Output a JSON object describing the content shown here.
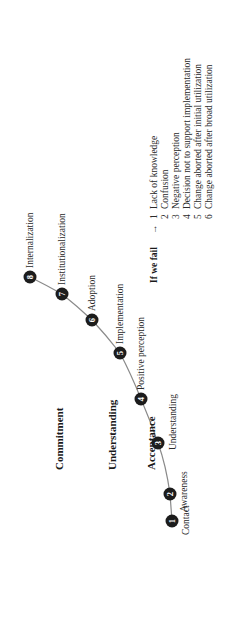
{
  "levels": [
    {
      "label": "Commitment"
    },
    {
      "label": "Understanding"
    },
    {
      "label": "Acceptance"
    }
  ],
  "stages": [
    {
      "num": "1",
      "label": "Contact"
    },
    {
      "num": "2",
      "label": "Awareness"
    },
    {
      "num": "3",
      "label": "Understanding"
    },
    {
      "num": "4",
      "label": "Positive perception"
    },
    {
      "num": "5",
      "label": "Implementation"
    },
    {
      "num": "6",
      "label": "Adoption"
    },
    {
      "num": "7",
      "label": "Institutionalization"
    },
    {
      "num": "8",
      "label": "Internalization"
    }
  ],
  "failure": {
    "heading": "If we fail",
    "arrow": "→",
    "items": [
      {
        "num": "1",
        "label": "Lack of knowledge"
      },
      {
        "num": "2",
        "label": "Confusion"
      },
      {
        "num": "3",
        "label": "Negative perception"
      },
      {
        "num": "4",
        "label": "Decision not to support implementation"
      },
      {
        "num": "5",
        "label": "Change aborted after initial utilization"
      },
      {
        "num": "6",
        "label": "Change aborted after broad utilization"
      }
    ]
  },
  "colors": {
    "node": "#1c1c1c",
    "line": "#8a8a8a",
    "text": "#2a2a2a"
  }
}
